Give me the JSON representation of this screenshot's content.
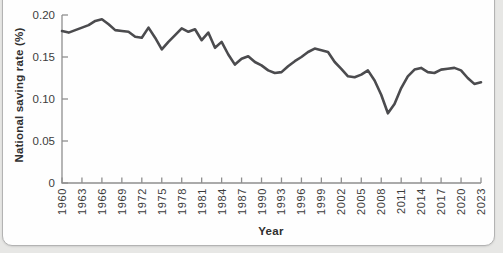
{
  "page": {
    "background_color": "#e7e7e5",
    "card_background": "#fefefe",
    "card_border_color": "#b3b3b3"
  },
  "chart_data": {
    "type": "line",
    "title": "",
    "xlabel": "Year",
    "ylabel": "National saving rate (%)",
    "series_name": "National saving rate",
    "x": [
      1960,
      1961,
      1962,
      1963,
      1964,
      1965,
      1966,
      1967,
      1968,
      1969,
      1970,
      1971,
      1972,
      1973,
      1974,
      1975,
      1976,
      1977,
      1978,
      1979,
      1980,
      1981,
      1982,
      1983,
      1984,
      1985,
      1986,
      1987,
      1988,
      1989,
      1990,
      1991,
      1992,
      1993,
      1994,
      1995,
      1996,
      1997,
      1998,
      1999,
      2000,
      2001,
      2002,
      2003,
      2004,
      2005,
      2006,
      2007,
      2008,
      2009,
      2010,
      2011,
      2012,
      2013,
      2014,
      2015,
      2016,
      2017,
      2018,
      2019,
      2020,
      2021,
      2022,
      2023
    ],
    "values": [
      0.181,
      0.179,
      0.182,
      0.185,
      0.188,
      0.193,
      0.195,
      0.189,
      0.182,
      0.181,
      0.18,
      0.174,
      0.173,
      0.185,
      0.173,
      0.159,
      0.168,
      0.176,
      0.184,
      0.18,
      0.183,
      0.17,
      0.179,
      0.161,
      0.168,
      0.153,
      0.141,
      0.148,
      0.151,
      0.144,
      0.14,
      0.134,
      0.131,
      0.132,
      0.139,
      0.145,
      0.15,
      0.156,
      0.16,
      0.158,
      0.156,
      0.144,
      0.136,
      0.127,
      0.126,
      0.129,
      0.134,
      0.122,
      0.105,
      0.083,
      0.094,
      0.113,
      0.127,
      0.135,
      0.137,
      0.132,
      0.131,
      0.135,
      0.136,
      0.137,
      0.134,
      0.125,
      0.118,
      0.12
    ],
    "xlim": [
      1960,
      2023
    ],
    "ylim": [
      0,
      0.2
    ],
    "xtick_years": [
      1960,
      1963,
      1966,
      1969,
      1972,
      1975,
      1978,
      1981,
      1984,
      1987,
      1990,
      1993,
      1996,
      1999,
      2002,
      2005,
      2008,
      2011,
      2014,
      2017,
      2020,
      2023
    ],
    "yticks": [
      {
        "value": 0,
        "label": "0"
      },
      {
        "value": 0.05,
        "label": "0.05"
      },
      {
        "value": 0.1,
        "label": "0.10"
      },
      {
        "value": 0.15,
        "label": "0.15"
      },
      {
        "value": 0.2,
        "label": "0.20"
      }
    ],
    "grid": false,
    "legend": "none",
    "line_color": "#4b4b4e",
    "line_width": 2.6,
    "axis_color": "#8f8f8f",
    "tick_label_color": "#3c3c3c"
  }
}
